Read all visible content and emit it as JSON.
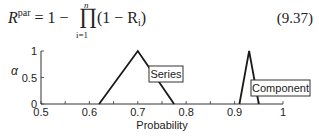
{
  "equation": {
    "lhs": "R",
    "lhs_sup": "par",
    "equals": "= 1 −",
    "operator": "∏",
    "upper_limit": "n",
    "lower_limit": "i=1",
    "rhs_open": "(1 − R",
    "rhs_sub": "i",
    "rhs_close": ")",
    "number": "(9.37)"
  },
  "chart_data": {
    "type": "line",
    "title": "",
    "xlabel": "Probability",
    "ylabel": "α",
    "xlim": [
      0.5,
      1.0
    ],
    "ylim": [
      0,
      1
    ],
    "x_ticks": [
      "0.5",
      "0.6",
      "0.7",
      "0.8",
      "0.9",
      "1"
    ],
    "y_ticks": [
      "0",
      "0.5",
      "1"
    ],
    "grid": false,
    "series": [
      {
        "name": "Series",
        "shape": "triangular fuzzy number",
        "x": [
          0.62,
          0.7,
          0.775
        ],
        "y": [
          0,
          1,
          0
        ]
      },
      {
        "name": "Component",
        "shape": "triangular fuzzy number",
        "x": [
          0.91,
          0.93,
          0.95
        ],
        "y": [
          0,
          1,
          0
        ]
      }
    ],
    "annotations": [
      "Series",
      "Component"
    ],
    "colors": {
      "line": "#1a1a1a",
      "axis": "#333333"
    }
  }
}
